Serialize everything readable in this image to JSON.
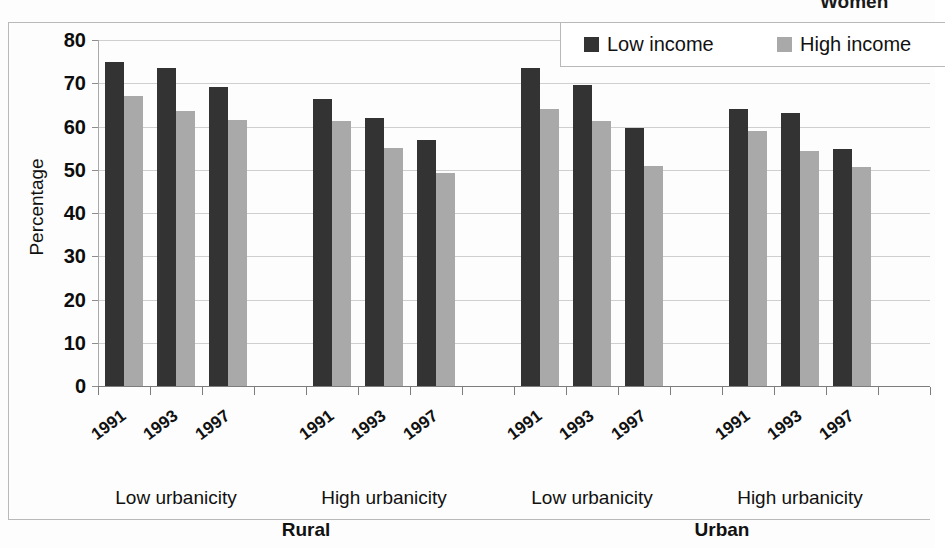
{
  "super_title": "Women",
  "chart_data": {
    "type": "bar",
    "title": "Women",
    "xlabel": "",
    "ylabel": "Percentage",
    "ylim": [
      0,
      80
    ],
    "ytick_step": 10,
    "yticks": [
      "80",
      "70",
      "60",
      "50",
      "40",
      "30",
      "20",
      "10",
      "0"
    ],
    "grid": true,
    "legend_position": "top-right",
    "legend": [
      "Low income",
      "High income"
    ],
    "colors": {
      "low_income": "#333333",
      "high_income": "#a9a9a9",
      "gridline": "#cfcfcf",
      "axis": "#7d7d7d",
      "text": "#111111",
      "background": "#ffffff"
    },
    "panels": [
      {
        "label": "Rural",
        "groups": [
          {
            "label": "Low urbanicity",
            "categories": [
              "1991",
              "1993",
              "1997"
            ],
            "series": [
              {
                "name": "Low income",
                "values": [
                  75.0,
                  73.5,
                  69.2
                ]
              },
              {
                "name": "High income",
                "values": [
                  67.0,
                  63.6,
                  61.4
                ]
              }
            ]
          },
          {
            "label": "High urbanicity",
            "categories": [
              "1991",
              "1993",
              "1997"
            ],
            "series": [
              {
                "name": "Low income",
                "values": [
                  66.4,
                  62.0,
                  56.8
                ]
              },
              {
                "name": "High income",
                "values": [
                  61.3,
                  55.1,
                  49.3
                ]
              }
            ]
          }
        ]
      },
      {
        "label": "Urban",
        "groups": [
          {
            "label": "Low urbanicity",
            "categories": [
              "1991",
              "1993",
              "1997"
            ],
            "series": [
              {
                "name": "Low income",
                "values": [
                  73.5,
                  69.6,
                  59.6
                ]
              },
              {
                "name": "High income",
                "values": [
                  64.1,
                  61.2,
                  50.9
                ]
              }
            ]
          },
          {
            "label": "High urbanicity",
            "categories": [
              "1991",
              "1993",
              "1997"
            ],
            "series": [
              {
                "name": "Low income",
                "values": [
                  64.0,
                  63.1,
                  54.8
                ]
              },
              {
                "name": "High income",
                "values": [
                  58.9,
                  54.4,
                  50.7
                ]
              }
            ]
          }
        ]
      }
    ]
  },
  "layout": {
    "plot_left": 98,
    "plot_right": 930,
    "y_top_px": 40,
    "y_bottom_px": 386,
    "slot_width": 52,
    "slots_per_panel": 8,
    "bar_width": 19
  }
}
